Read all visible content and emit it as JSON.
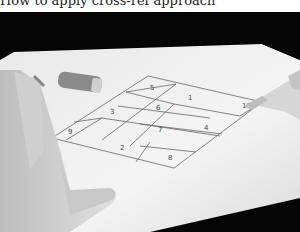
{
  "caption": {
    "text": "How to apply cross-ref approach"
  },
  "photo": {
    "description": "Black-and-white photo of hands on a sheet of paper with a hand-drawn parallelogram grid divided into numbered regions, a capped pen lying on the paper",
    "grid_labels": [
      {
        "id": "1",
        "label": "1"
      },
      {
        "id": "2",
        "label": "2"
      },
      {
        "id": "3",
        "label": "3"
      },
      {
        "id": "4",
        "label": "4"
      },
      {
        "id": "5",
        "label": "5"
      },
      {
        "id": "6",
        "label": "6"
      },
      {
        "id": "7",
        "label": "7"
      },
      {
        "id": "8",
        "label": "8"
      },
      {
        "id": "9",
        "label": "9"
      },
      {
        "id": "10",
        "label": "10"
      }
    ]
  }
}
